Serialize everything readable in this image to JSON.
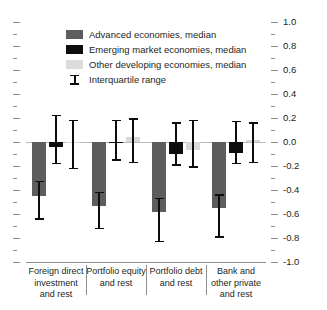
{
  "chart_data": {
    "type": "bar",
    "title": "",
    "subtitle": "",
    "xlabel": "",
    "ylabel": "",
    "ylim": [
      -1.0,
      1.0
    ],
    "ytick_step": 0.2,
    "yminor_step": 0.1,
    "grid": false,
    "legend_position": "upper-center",
    "orientation": "vertical",
    "zero_line": true,
    "categories": [
      "Foreign direct investment and rest",
      "Portfolio equity and rest",
      "Portfolio debt and rest",
      "Bank and other private and rest"
    ],
    "ytick_labels": [
      "1.0",
      "0.8",
      "0.6",
      "0.4",
      "0.2",
      "0.0",
      "-0.2",
      "-0.4",
      "-0.6",
      "-0.8",
      "-1.0"
    ],
    "ytick_values": [
      1.0,
      0.8,
      0.6,
      0.4,
      0.2,
      0.0,
      -0.2,
      -0.4,
      -0.6,
      -0.8,
      -1.0
    ],
    "series": [
      {
        "name": "Advanced economies, median",
        "color": "#5d5d5d",
        "values": [
          -0.45,
          -0.53,
          -0.58,
          -0.55
        ],
        "iqr_low": [
          -0.64,
          -0.72,
          -0.83,
          -0.79
        ],
        "iqr_high": [
          -0.33,
          -0.42,
          -0.47,
          -0.44
        ]
      },
      {
        "name": "Emerging market economies, median",
        "color": "#0d0d0d",
        "values": [
          -0.04,
          -0.01,
          -0.1,
          -0.09
        ],
        "iqr_low": [
          -0.18,
          -0.15,
          -0.19,
          -0.18
        ],
        "iqr_high": [
          0.22,
          0.18,
          0.16,
          0.17
        ]
      },
      {
        "name": "Other developing economies, median",
        "color": "#d8d8d8",
        "values": [
          0.0,
          0.04,
          -0.07,
          0.02
        ],
        "iqr_low": [
          -0.22,
          -0.17,
          -0.21,
          -0.17
        ],
        "iqr_high": [
          0.18,
          0.19,
          0.18,
          0.16
        ]
      }
    ],
    "annotations": []
  },
  "legend": {
    "items": [
      {
        "label": "Advanced economies, median",
        "marker": "square-dark-gray"
      },
      {
        "label": "Emerging market economies, median",
        "marker": "square-black"
      },
      {
        "label": "Other developing economies, median",
        "marker": "square-light-gray"
      },
      {
        "label": "Interquartile range",
        "marker": "i-bar-icon"
      }
    ]
  },
  "axis": {
    "right_labels": [
      "1.0",
      "0.8",
      "0.6",
      "0.4",
      "0.2",
      "0.0",
      "-0.2",
      "-0.4",
      "-0.6",
      "-0.8",
      "-1.0"
    ]
  },
  "colors": {
    "advanced": "#5d5d5d",
    "emerging": "#0d0d0d",
    "other_developing": "#d8d8d8",
    "axis": "#8d8d8d",
    "zero_line": "#b9b9b9",
    "text": "#231f20",
    "background": "#ffffff"
  }
}
